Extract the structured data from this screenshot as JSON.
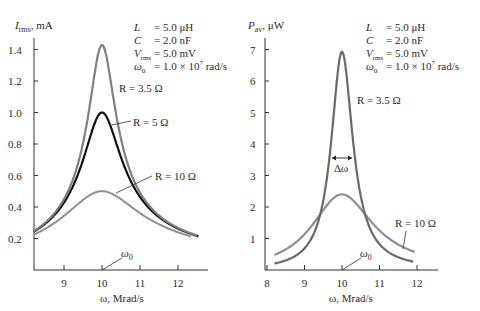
{
  "chart_data": [
    {
      "type": "line",
      "title": "",
      "xlabel": "ω, Mrad/s",
      "ylabel": "I_rms, mA",
      "xlim": [
        8.2,
        12.8
      ],
      "ylim": [
        0,
        1.5
      ],
      "xticks": [
        "9",
        "10",
        "11",
        "12"
      ],
      "yticks": [
        "0.2",
        "0.4",
        "0.6",
        "0.8",
        "1.0",
        "1.2",
        "1.4"
      ],
      "grid": false,
      "x": [
        8.2,
        9.0,
        9.5,
        10.0,
        10.5,
        11.0,
        12.0
      ],
      "series": [
        {
          "name": "R = 3.5 Ω",
          "R": 3.5,
          "values": [
            0.25,
            0.45,
            0.81,
            1.43,
            0.83,
            0.49,
            0.27
          ],
          "color": "#7a7a7a"
        },
        {
          "name": "R = 5 Ω",
          "R": 5,
          "values": [
            0.24,
            0.43,
            0.7,
            1.0,
            0.72,
            0.46,
            0.26
          ],
          "color": "#111111"
        },
        {
          "name": "R = 10 Ω",
          "R": 10,
          "values": [
            0.22,
            0.34,
            0.45,
            0.5,
            0.45,
            0.36,
            0.24
          ],
          "color": "#8c8c8c"
        }
      ],
      "annotations": [
        "R = 3.5 Ω",
        "R = 5 Ω",
        "R = 10 Ω",
        "ω0"
      ]
    },
    {
      "type": "line",
      "title": "",
      "xlabel": "ω, Mrad/s",
      "ylabel": "P_av, μW",
      "xlim": [
        8,
        12.6
      ],
      "ylim": [
        0,
        7.5
      ],
      "xticks": [
        "8",
        "9",
        "10",
        "11",
        "12"
      ],
      "yticks": [
        "1",
        "2",
        "3",
        "4",
        "5",
        "6",
        "7"
      ],
      "grid": false,
      "x": [
        8.2,
        9.0,
        9.5,
        10.0,
        10.5,
        11.0,
        11.9
      ],
      "series": [
        {
          "name": "R = 3.5 Ω",
          "R": 3.5,
          "values": [
            0.21,
            0.71,
            2.27,
            7.0,
            2.43,
            0.84,
            0.22
          ],
          "color": "#6e6e6e"
        },
        {
          "name": "R = 10 Ω",
          "R": 10,
          "values": [
            0.5,
            1.18,
            1.98,
            2.4,
            2.02,
            1.31,
            0.58
          ],
          "color": "#8c8c8c"
        }
      ],
      "annotations": [
        "R = 3.5 Ω",
        "R = 10 Ω",
        "Δω",
        "ω0"
      ]
    }
  ],
  "params": {
    "L_label": "L",
    "L_value": "= 5.0 μH",
    "C_label": "C",
    "C_value": "= 2.0 nF",
    "V_label": "V",
    "V_sub": "rms",
    "V_value": "= 5.0 mV",
    "w0_label": "ω",
    "w0_sub": "0",
    "w0_value": "=  1.0 × 10",
    "w0_exp": "7",
    "w0_unit": " rad/s"
  },
  "left": {
    "ylabel_main": "I",
    "ylabel_sub": "rms",
    "ylabel_unit": ", mA",
    "xlabel": "ω, Mrad/s",
    "label_r35": "R = 3.5 Ω",
    "label_r5": "R = 5 Ω",
    "label_r10": "R = 10 Ω",
    "w0": "ω",
    "w0_sub": "0"
  },
  "right": {
    "ylabel_main": "P",
    "ylabel_sub": "av",
    "ylabel_unit": ", μW",
    "xlabel": "ω, Mrad/s",
    "label_r35": "R = 3.5 Ω",
    "label_r10": "R = 10 Ω",
    "delta": "Δω",
    "w0": "ω",
    "w0_sub": "0"
  }
}
